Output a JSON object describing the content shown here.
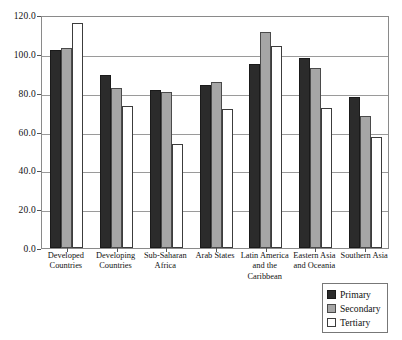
{
  "chart_data": {
    "type": "bar",
    "title": "",
    "subtitle": "",
    "xlabel": "",
    "ylabel": "",
    "ylim": [
      0,
      120
    ],
    "ytick_step": 20,
    "ytick_labels": [
      "0.0",
      "20.0",
      "40.0",
      "60.0",
      "80.0",
      "100.0",
      "120.0"
    ],
    "grid": true,
    "legend_position": "bottom-right",
    "categories": [
      "Developed Countries",
      "Developing Countries",
      "Sub-Saharan Africa",
      "Arab States",
      "Latin America and the Caribbean",
      "Eastern Asia and Oceania",
      "Southern Asia"
    ],
    "category_label_lines": [
      [
        "Developed",
        "Countries"
      ],
      [
        "Developing",
        "Countries"
      ],
      [
        "Sub-Saharan",
        "Africa"
      ],
      [
        "Arab States"
      ],
      [
        "Latin America",
        "and the",
        "Caribbean"
      ],
      [
        "Eastern Asia",
        "and Oceania"
      ],
      [
        "Southern Asia"
      ]
    ],
    "series": [
      {
        "name": "Primary",
        "color": "#2b2b2b",
        "values": [
          102.0,
          89.0,
          81.5,
          84.0,
          95.0,
          98.0,
          78.0
        ]
      },
      {
        "name": "Secondary",
        "color": "#a6a6a6",
        "values": [
          103.0,
          82.5,
          80.5,
          85.5,
          111.0,
          92.5,
          68.0
        ]
      },
      {
        "name": "Tertiary",
        "color": "#ffffff",
        "values": [
          116.0,
          73.0,
          53.5,
          71.5,
          104.0,
          72.0,
          57.0
        ]
      }
    ]
  },
  "legend": {
    "items": [
      {
        "label": "Primary",
        "swatch": "primary-swatch-icon"
      },
      {
        "label": "Secondary",
        "swatch": "secondary-swatch-icon"
      },
      {
        "label": "Tertiary",
        "swatch": "tertiary-swatch-icon"
      }
    ]
  }
}
